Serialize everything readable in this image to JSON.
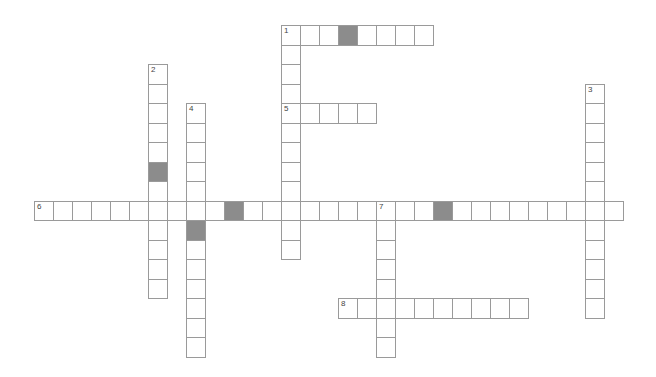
{
  "puzzle": {
    "grid": {
      "origin_x": 34,
      "origin_y": 25,
      "cell_w": 19,
      "cell_h": 19.5,
      "border_color": "#9a9a9a",
      "blocked_color": "#8c8c8c"
    },
    "words": [
      {
        "number": "1",
        "direction": "across",
        "row": 0,
        "col": 13,
        "length": 8
      },
      {
        "number": "1",
        "direction": "down",
        "row": 0,
        "col": 13,
        "length": 12
      },
      {
        "number": "2",
        "direction": "down",
        "row": 2,
        "col": 6,
        "length": 12
      },
      {
        "number": "3",
        "direction": "down",
        "row": 3,
        "col": 29,
        "length": 12
      },
      {
        "number": "4",
        "direction": "down",
        "row": 4,
        "col": 8,
        "length": 13
      },
      {
        "number": "5",
        "direction": "across",
        "row": 4,
        "col": 13,
        "length": 5
      },
      {
        "number": "6",
        "direction": "across",
        "row": 9,
        "col": 0,
        "length": 31
      },
      {
        "number": "7",
        "direction": "down",
        "row": 9,
        "col": 18,
        "length": 8
      },
      {
        "number": "8",
        "direction": "across",
        "row": 14,
        "col": 16,
        "length": 10
      }
    ],
    "blocked_cells": [
      {
        "row": 0,
        "col": 16
      },
      {
        "row": 7,
        "col": 6
      },
      {
        "row": 9,
        "col": 10
      },
      {
        "row": 9,
        "col": 21
      },
      {
        "row": 10,
        "col": 8
      }
    ]
  }
}
